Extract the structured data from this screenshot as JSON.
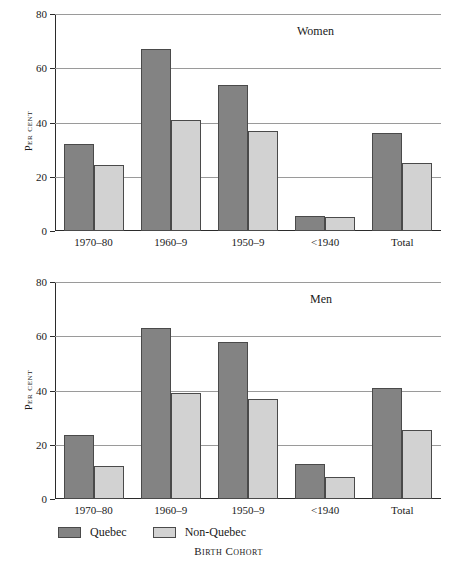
{
  "chart_data": [
    {
      "type": "bar",
      "title": "Women",
      "xlabel": "Birth Cohort",
      "ylabel": "Per cent",
      "ylim": [
        0,
        80
      ],
      "yticks": [
        0,
        20,
        40,
        60,
        80
      ],
      "grid": true,
      "legend_position": "below",
      "categories": [
        "1970–80",
        "1960–9",
        "1950–9",
        "<1940",
        "Total"
      ],
      "series": [
        {
          "name": "Quebec",
          "color": "#838383",
          "values": [
            32,
            67,
            54,
            5.5,
            36
          ]
        },
        {
          "name": "Non-Quebec",
          "color": "#d2d2d2",
          "values": [
            24.5,
            41,
            37,
            5,
            25
          ]
        }
      ]
    },
    {
      "type": "bar",
      "title": "Men",
      "xlabel": "Birth Cohort",
      "ylabel": "Per cent",
      "ylim": [
        0,
        80
      ],
      "yticks": [
        0,
        20,
        40,
        60,
        80
      ],
      "grid": true,
      "legend_position": "below",
      "categories": [
        "1970–80",
        "1960–9",
        "1950–9",
        "<1940",
        "Total"
      ],
      "series": [
        {
          "name": "Quebec",
          "color": "#838383",
          "values": [
            23.5,
            63,
            58,
            13,
            41
          ]
        },
        {
          "name": "Non-Quebec",
          "color": "#d2d2d2",
          "values": [
            12,
            39,
            37,
            8,
            25.5
          ]
        }
      ]
    }
  ],
  "panels": {
    "women": {
      "title": "Women",
      "ylabel": "Per cent",
      "yticks": [
        "80",
        "60",
        "40",
        "20",
        "0"
      ],
      "categories": [
        "1970–80",
        "1960–9",
        "1950–9",
        "<1940",
        "Total"
      ]
    },
    "men": {
      "title": "Men",
      "ylabel": "Per cent",
      "yticks": [
        "80",
        "60",
        "40",
        "20",
        "0"
      ],
      "categories": [
        "1970–80",
        "1960–9",
        "1950–9",
        "<1940",
        "Total"
      ]
    }
  },
  "legend": {
    "items": [
      {
        "label": "Quebec",
        "color": "#838383"
      },
      {
        "label": "Non-Quebec",
        "color": "#d2d2d2"
      }
    ]
  },
  "xlabel": "Birth Cohort"
}
